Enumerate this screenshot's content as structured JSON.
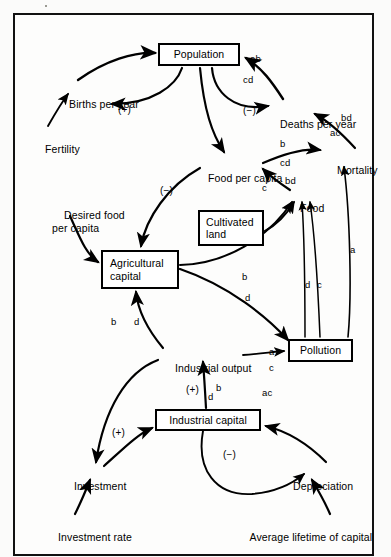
{
  "figure": {
    "kind": "causal-loop-diagram",
    "border_color": "#111111",
    "background": "#fdfdfc"
  },
  "boxes": [
    {
      "id": "population",
      "label": "Population",
      "x": 158,
      "y": 43,
      "w": 82,
      "h": 23
    },
    {
      "id": "cultivated-land",
      "label": "Cultivated\nland",
      "x": 198,
      "y": 210,
      "w": 66,
      "h": 36
    },
    {
      "id": "agricultural-capital",
      "label": "Agricultural\ncapital",
      "x": 101,
      "y": 250,
      "w": 78,
      "h": 39
    },
    {
      "id": "pollution",
      "label": "Pollution",
      "x": 288,
      "y": 339,
      "w": 65,
      "h": 23
    },
    {
      "id": "industrial-capital",
      "label": "Industrial capital",
      "x": 155,
      "y": 409,
      "w": 106,
      "h": 22
    }
  ],
  "texts": [
    {
      "id": "births-per-year",
      "label": "Births per year",
      "x": 57,
      "y": 86
    },
    {
      "id": "deaths-per-year",
      "label": "Deaths per year",
      "x": 268,
      "y": 106
    },
    {
      "id": "fertility",
      "label": "Fertility",
      "x": 33,
      "y": 131
    },
    {
      "id": "mortality",
      "label": "Mortality",
      "x": 325,
      "y": 152
    },
    {
      "id": "food-per-capita",
      "label": "Food per capita",
      "x": 196,
      "y": 160
    },
    {
      "id": "food",
      "label": "Food",
      "x": 288,
      "y": 190
    },
    {
      "id": "desired-food-per-capita",
      "label": "Desired food\nper capita",
      "x": 52,
      "y": 197
    },
    {
      "id": "industrial-output",
      "label": "Industrial output",
      "x": 163,
      "y": 350
    },
    {
      "id": "investment",
      "label": "Investment",
      "x": 62,
      "y": 468
    },
    {
      "id": "depreciation",
      "label": "Depreciation",
      "x": 281,
      "y": 468
    },
    {
      "id": "investment-rate",
      "label": "Investment rate",
      "x": 46,
      "y": 519
    },
    {
      "id": "average-lifetime",
      "label": "Average lifetime of capital",
      "x": 238,
      "y": 519
    }
  ],
  "edge_labels": [
    {
      "id": "lbl-ab-population",
      "label": "ab",
      "x": 250,
      "y": 54
    },
    {
      "id": "lbl-cd-population",
      "label": "cd",
      "x": 243,
      "y": 75
    },
    {
      "id": "lbl-bd-mortality",
      "label": "bd",
      "x": 341,
      "y": 113
    },
    {
      "id": "lbl-ac-mortality",
      "label": "ac",
      "x": 330,
      "y": 128
    },
    {
      "id": "lbl-b-foodpercapita",
      "label": "b",
      "x": 280,
      "y": 139
    },
    {
      "id": "lbl-cd-foodpercapita",
      "label": "cd",
      "x": 280,
      "y": 158
    },
    {
      "id": "lbl-bd-food",
      "label": "bd",
      "x": 285,
      "y": 176
    },
    {
      "id": "lbl-c-food",
      "label": "c",
      "x": 262,
      "y": 183
    },
    {
      "id": "lbl-a-pollution-mortality",
      "label": "a",
      "x": 350,
      "y": 245
    },
    {
      "id": "lbl-b-agcap-food",
      "label": "b",
      "x": 242,
      "y": 272
    },
    {
      "id": "lbl-d-pollution-food",
      "label": "d",
      "x": 305,
      "y": 280
    },
    {
      "id": "lbl-c-pollution-food",
      "label": "c",
      "x": 317,
      "y": 280
    },
    {
      "id": "lbl-d-agcap-pollution",
      "label": "d",
      "x": 245,
      "y": 293
    },
    {
      "id": "lbl-b-indout-agcap",
      "label": "b",
      "x": 111,
      "y": 317
    },
    {
      "id": "lbl-d-indout-agcap",
      "label": "d",
      "x": 134,
      "y": 317
    },
    {
      "id": "lbl-a-indout-pollution",
      "label": "a",
      "x": 269,
      "y": 347
    },
    {
      "id": "lbl-c-indout-pollution",
      "label": "c",
      "x": 269,
      "y": 363
    },
    {
      "id": "lbl-b-indcap-output",
      "label": "b",
      "x": 216,
      "y": 383
    },
    {
      "id": "lbl-d-indcap-output",
      "label": "d",
      "x": 208,
      "y": 392
    },
    {
      "id": "lbl-ac-indcap",
      "label": "ac",
      "x": 262,
      "y": 388
    }
  ],
  "polarities": [
    {
      "id": "plus-birth-loop",
      "label": "(+)",
      "x": 118,
      "y": 105
    },
    {
      "id": "minus-death-loop",
      "label": "(−)",
      "x": 243,
      "y": 106
    },
    {
      "id": "minus-food-loop",
      "label": "(−)",
      "x": 160,
      "y": 186
    },
    {
      "id": "plus-output-capital",
      "label": "(+)",
      "x": 186,
      "y": 385
    },
    {
      "id": "plus-investment-loop",
      "label": "(+)",
      "x": 112,
      "y": 428
    },
    {
      "id": "minus-depreciation",
      "label": "(−)",
      "x": 223,
      "y": 450
    }
  ]
}
